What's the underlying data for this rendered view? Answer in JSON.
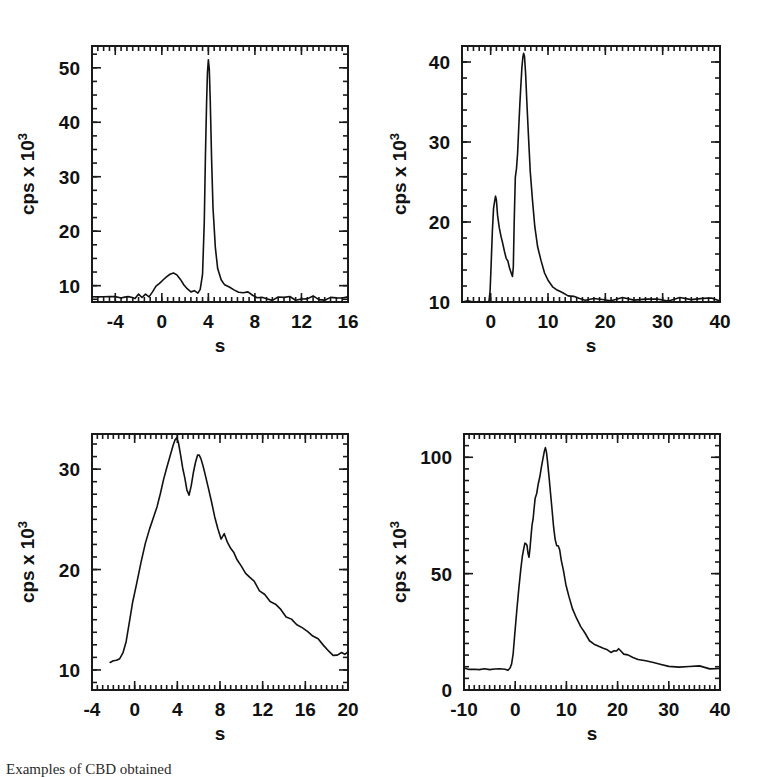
{
  "figure": {
    "background": "#ffffff",
    "ink_color": "#111111",
    "caption_fragment": "Examples of CBD obtained"
  },
  "axis_labels": {
    "y_prefix": "cps x 10",
    "y_exponent": "3",
    "x": "s"
  },
  "chart_data": [
    {
      "type": "line",
      "panel": "top-left",
      "title": "",
      "xlabel": "s",
      "ylabel": "cps x 10^3",
      "xlim": [
        -6,
        16
      ],
      "ylim": [
        7,
        54
      ],
      "xticks": [
        -4,
        0,
        4,
        8,
        12,
        16
      ],
      "xticklabels": [
        "-4",
        "0",
        "4",
        "8",
        "12",
        "16"
      ],
      "yticks": [
        10,
        20,
        30,
        40,
        50
      ],
      "yticklabels": [
        "10",
        "20",
        "30",
        "40",
        "50"
      ],
      "grid": false,
      "legend": "none",
      "minor_ticks": true,
      "series": [
        {
          "name": "cps",
          "x": [
            -6.0,
            -5.5,
            -5.0,
            -4.5,
            -4.0,
            -3.5,
            -3.2,
            -2.9,
            -2.6,
            -2.3,
            -2.0,
            -1.7,
            -1.4,
            -1.1,
            -0.8,
            -0.5,
            -0.2,
            0.1,
            0.4,
            0.7,
            1.0,
            1.3,
            1.6,
            1.9,
            2.2,
            2.5,
            2.8,
            3.1,
            3.3,
            3.5,
            3.65,
            3.75,
            3.85,
            3.92,
            4.0,
            4.08,
            4.16,
            4.28,
            4.4,
            4.6,
            4.8,
            5.1,
            5.4,
            5.8,
            6.2,
            6.6,
            7.0,
            7.4,
            7.8,
            8.2,
            8.6,
            9.0,
            9.5,
            10.0,
            10.5,
            11.0,
            11.5,
            12.0,
            12.5,
            13.0,
            13.5,
            14.0,
            14.5,
            15.0,
            15.5,
            16.0
          ],
          "y": [
            8.0,
            8.0,
            8.0,
            8.0,
            8.0,
            8.0,
            8.0,
            7.7,
            8.1,
            7.8,
            8.3,
            8.0,
            8.6,
            8.2,
            9.0,
            9.8,
            10.6,
            11.3,
            11.8,
            12.0,
            12.1,
            11.9,
            11.3,
            10.4,
            9.5,
            9.0,
            8.8,
            8.8,
            9.2,
            12.0,
            22.0,
            34.0,
            44.0,
            49.0,
            51.5,
            50.0,
            44.0,
            33.0,
            24.0,
            17.0,
            13.0,
            11.0,
            10.1,
            9.5,
            9.2,
            9.0,
            8.9,
            8.8,
            8.5,
            7.9,
            7.6,
            7.7,
            7.5,
            7.8,
            7.6,
            7.9,
            7.6,
            7.8,
            7.6,
            7.9,
            7.7,
            7.6,
            7.9,
            7.7,
            7.8,
            7.7
          ]
        }
      ]
    },
    {
      "type": "line",
      "panel": "top-right",
      "title": "",
      "xlabel": "s",
      "ylabel": "cps x 10^3",
      "xlim": [
        -5,
        40
      ],
      "ylim": [
        10,
        42
      ],
      "xticks": [
        0,
        10,
        20,
        30,
        40
      ],
      "xticklabels": [
        "0",
        "10",
        "20",
        "30",
        "40"
      ],
      "yticks": [
        10,
        20,
        30,
        40
      ],
      "yticklabels": [
        "10",
        "20",
        "30",
        "40"
      ],
      "grid": false,
      "legend": "none",
      "minor_ticks": true,
      "series": [
        {
          "name": "cps",
          "x": [
            -5.0,
            -4.0,
            -3.0,
            -2.0,
            -1.5,
            -1.0,
            -0.6,
            -0.3,
            -0.1,
            0.1,
            0.3,
            0.5,
            0.7,
            0.85,
            1.0,
            1.2,
            1.5,
            1.8,
            2.1,
            2.4,
            2.7,
            3.0,
            3.3,
            3.6,
            3.8,
            3.95,
            4.1,
            4.3,
            4.5,
            4.7,
            4.9,
            5.1,
            5.3,
            5.45,
            5.6,
            5.75,
            5.9,
            6.1,
            6.3,
            6.6,
            6.9,
            7.3,
            7.7,
            8.2,
            8.8,
            9.4,
            10.0,
            10.8,
            11.6,
            12.5,
            13.5,
            14.5,
            15.5,
            16.5,
            18.0,
            19.5,
            21.0,
            23.0,
            25.0,
            27.0,
            29.0,
            31.0,
            33.0,
            35.0,
            37.0,
            38.5,
            40.0
          ],
          "y": [
            10.0,
            10.0,
            10.0,
            10.0,
            10.0,
            10.0,
            10.0,
            10.1,
            11.5,
            15.0,
            19.0,
            21.5,
            22.8,
            23.2,
            22.6,
            21.0,
            19.3,
            18.2,
            17.3,
            16.4,
            15.6,
            15.0,
            14.3,
            13.6,
            13.1,
            14.5,
            20.0,
            25.5,
            26.8,
            28.5,
            32.0,
            35.0,
            37.5,
            39.2,
            40.5,
            41.2,
            40.8,
            38.5,
            35.0,
            30.5,
            26.5,
            22.5,
            19.5,
            17.0,
            15.0,
            13.6,
            12.8,
            12.0,
            11.5,
            11.1,
            10.8,
            10.6,
            10.5,
            10.4,
            10.3,
            10.4,
            10.3,
            10.4,
            10.3,
            10.4,
            10.3,
            10.3,
            10.4,
            10.3,
            10.3,
            10.4,
            10.3
          ]
        }
      ]
    },
    {
      "type": "line",
      "panel": "bottom-left",
      "title": "",
      "xlabel": "s",
      "ylabel": "cps x 10^3",
      "xlim": [
        -4,
        20
      ],
      "ylim": [
        8,
        33.5
      ],
      "xticks": [
        -4,
        0,
        4,
        8,
        12,
        16,
        20
      ],
      "xticklabels": [
        "-4",
        "0",
        "4",
        "8",
        "12",
        "16",
        "20"
      ],
      "yticks": [
        10,
        20,
        30
      ],
      "yticklabels": [
        "10",
        "20",
        "30"
      ],
      "grid": false,
      "legend": "none",
      "minor_ticks": true,
      "series": [
        {
          "name": "cps",
          "x": [
            -2.3,
            -2.0,
            -1.7,
            -1.4,
            -1.1,
            -0.8,
            -0.5,
            -0.2,
            0.2,
            0.6,
            1.0,
            1.4,
            1.8,
            2.1,
            2.4,
            2.7,
            3.0,
            3.2,
            3.4,
            3.6,
            3.8,
            3.95,
            4.1,
            4.3,
            4.5,
            4.7,
            4.9,
            5.1,
            5.3,
            5.5,
            5.7,
            5.9,
            6.05,
            6.2,
            6.4,
            6.6,
            6.9,
            7.2,
            7.5,
            7.8,
            8.1,
            8.4,
            8.7,
            9.0,
            9.3,
            9.6,
            10.0,
            10.4,
            10.8,
            11.2,
            11.7,
            12.2,
            12.7,
            13.2,
            13.7,
            14.2,
            14.7,
            15.2,
            15.7,
            16.2,
            16.7,
            17.2,
            17.7,
            18.2,
            18.6,
            19.0,
            19.4,
            19.7,
            20.0
          ],
          "y": [
            10.6,
            10.8,
            11.0,
            11.1,
            11.6,
            12.8,
            14.6,
            16.6,
            18.8,
            20.8,
            22.5,
            23.9,
            25.4,
            26.4,
            27.6,
            28.8,
            30.0,
            30.8,
            31.6,
            32.3,
            32.9,
            33.1,
            32.6,
            31.5,
            30.2,
            29.0,
            28.0,
            27.3,
            28.4,
            29.6,
            30.7,
            31.3,
            31.5,
            31.0,
            30.4,
            29.5,
            28.2,
            26.8,
            25.4,
            24.2,
            23.0,
            23.5,
            22.6,
            22.0,
            21.6,
            21.0,
            20.4,
            19.7,
            19.3,
            18.7,
            18.0,
            17.4,
            16.8,
            16.4,
            16.0,
            15.4,
            15.0,
            14.6,
            14.2,
            13.8,
            13.4,
            13.0,
            12.4,
            12.0,
            11.4,
            11.6,
            11.8,
            11.6,
            11.7
          ]
        }
      ]
    },
    {
      "type": "line",
      "panel": "bottom-right",
      "title": "",
      "xlabel": "s",
      "ylabel": "cps x 10^3",
      "xlim": [
        -10,
        40
      ],
      "ylim": [
        0,
        110
      ],
      "xticks": [
        -10,
        0,
        10,
        20,
        30,
        40
      ],
      "xticklabels": [
        "-10",
        "0",
        "10",
        "20",
        "30",
        "40"
      ],
      "yticks": [
        0,
        50,
        100
      ],
      "yticklabels": [
        "0",
        "50",
        "100"
      ],
      "grid": false,
      "legend": "none",
      "minor_ticks": true,
      "series": [
        {
          "name": "cps",
          "x": [
            -10.0,
            -9.0,
            -8.0,
            -7.0,
            -6.0,
            -5.0,
            -4.0,
            -3.0,
            -2.0,
            -1.4,
            -1.0,
            -0.7,
            -0.4,
            -0.1,
            0.3,
            0.7,
            1.1,
            1.4,
            1.7,
            1.9,
            2.1,
            2.3,
            2.5,
            2.7,
            2.9,
            3.1,
            3.3,
            3.5,
            3.7,
            3.9,
            4.2,
            4.5,
            4.8,
            5.1,
            5.4,
            5.7,
            5.9,
            6.1,
            6.3,
            6.6,
            6.9,
            7.2,
            7.5,
            7.8,
            8.1,
            8.4,
            8.7,
            9.0,
            9.4,
            9.9,
            10.5,
            11.2,
            12.0,
            12.8,
            13.6,
            14.5,
            15.4,
            16.3,
            17.2,
            18.0,
            18.7,
            19.3,
            19.8,
            20.2,
            20.6,
            21.2,
            22.0,
            23.0,
            24.0,
            25.5,
            27.0,
            28.5,
            30.0,
            32.0,
            34.0,
            36.0,
            38.0,
            40.0
          ],
          "y": [
            9.0,
            9.0,
            9.0,
            9.0,
            9.0,
            9.0,
            9.0,
            9.0,
            9.0,
            9.0,
            9.2,
            11.0,
            16.0,
            24.0,
            34.0,
            43.0,
            52.0,
            57.5,
            61.0,
            62.5,
            63.0,
            62.0,
            58.5,
            57.0,
            61.0,
            66.0,
            71.0,
            74.0,
            78.0,
            82.0,
            85.0,
            88.0,
            91.0,
            95.0,
            99.0,
            102.5,
            104.0,
            103.0,
            99.0,
            92.0,
            84.0,
            77.0,
            70.0,
            65.0,
            62.5,
            62.0,
            60.0,
            56.0,
            51.0,
            45.0,
            40.0,
            35.0,
            30.5,
            27.0,
            24.0,
            21.5,
            19.5,
            18.2,
            17.3,
            16.8,
            16.4,
            16.2,
            16.6,
            17.2,
            16.8,
            16.0,
            15.0,
            14.2,
            13.6,
            12.8,
            12.0,
            11.0,
            10.6,
            10.2,
            10.0,
            9.8,
            9.6,
            9.5
          ]
        }
      ]
    }
  ]
}
